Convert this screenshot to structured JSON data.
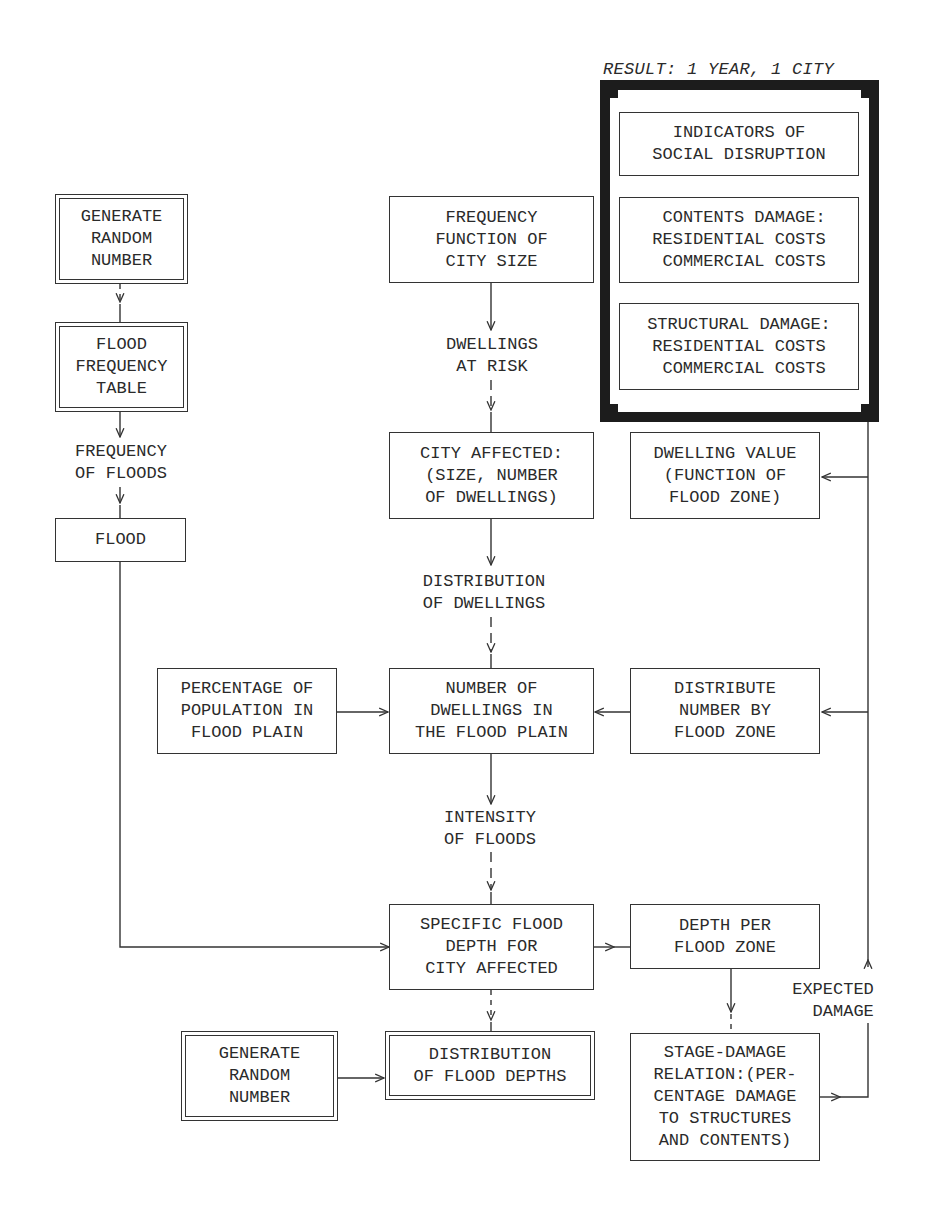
{
  "result_panel": {
    "title": "RESULT: 1 YEAR, 1 CITY",
    "boxes": [
      {
        "text": "INDICATORS OF\nSOCIAL DISRUPTION"
      },
      {
        "text": " CONTENTS DAMAGE:\nRESIDENTIAL COSTS\n COMMERCIAL COSTS"
      },
      {
        "text": "STRUCTURAL DAMAGE:\nRESIDENTIAL COSTS\n COMMERCIAL COSTS"
      }
    ]
  },
  "left_column": {
    "generate_random": "GENERATE\nRANDOM\nNUMBER",
    "flood_frequency_table": "FLOOD\nFREQUENCY\nTABLE",
    "frequency_label": "FREQUENCY\nOF FLOODS",
    "flood": "FLOOD"
  },
  "center_column": {
    "frequency_function": "FREQUENCY\nFUNCTION OF\nCITY SIZE",
    "dwellings_at_risk": "DWELLINGS\nAT RISK",
    "city_affected": "CITY AFFECTED:\n(SIZE, NUMBER\nOF DWELLINGS)",
    "distribution_of_dwellings": "DISTRIBUTION\nOF DWELLINGS",
    "number_of_dwellings": "NUMBER OF\nDWELLINGS IN\nTHE FLOOD PLAIN",
    "intensity_of_floods": "INTENSITY\nOF FLOODS",
    "specific_flood_depth": "SPECIFIC FLOOD\nDEPTH FOR\nCITY AFFECTED",
    "distribution_of_flood_depths": "DISTRIBUTION\nOF FLOOD DEPTHS"
  },
  "side_boxes": {
    "percentage_population": "PERCENTAGE OF\nPOPULATION IN\nFLOOD PLAIN",
    "generate_random_bottom": "GENERATE\nRANDOM\nNUMBER",
    "dwelling_value": "DWELLING VALUE\n(FUNCTION OF\nFLOOD ZONE)",
    "distribute_number": "DISTRIBUTE\nNUMBER BY\nFLOOD ZONE",
    "depth_per_zone": "DEPTH PER\nFLOOD ZONE",
    "stage_damage": "STAGE-DAMAGE\nRELATION:(PER-\nCENTAGE DAMAGE\nTO STRUCTURES\nAND CONTENTS)",
    "expected_damage": "EXPECTED\n  DAMAGE"
  },
  "colors": {
    "line": "#333333",
    "frame": "#1c1c1c",
    "background": "#ffffff"
  }
}
